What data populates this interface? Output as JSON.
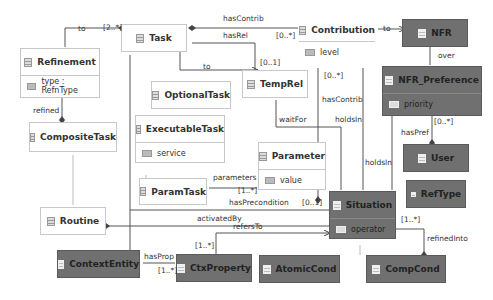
{
  "diagram": {
    "type": "uml-class-diagram",
    "classes": {
      "task": {
        "name": "Task"
      },
      "refinement": {
        "name": "Refinement",
        "attr": "type : RefnType"
      },
      "composite_task": {
        "name": "CompositeTask"
      },
      "optional_task": {
        "name": "OptionalTask"
      },
      "executable_task": {
        "name": "ExecutableTask",
        "attr": "service"
      },
      "param_task": {
        "name": "ParamTask"
      },
      "routine": {
        "name": "Routine"
      },
      "temp_rel": {
        "name": "TempRel"
      },
      "parameter": {
        "name": "Parameter",
        "attr": "value"
      },
      "contribution": {
        "name": "Contribution",
        "attr": "level"
      },
      "nfr": {
        "name": "NFR"
      },
      "nfr_preference": {
        "name": "NFR_Preference",
        "attr": "priority"
      },
      "user": {
        "name": "User"
      },
      "ref_type": {
        "name": "RefType"
      },
      "situation": {
        "name": "Situation",
        "attr": "operator"
      },
      "atomic_cond": {
        "name": "AtomicCond"
      },
      "comp_cond": {
        "name": "CompCond"
      },
      "context_entity": {
        "name": "ContextEntity"
      },
      "ctx_property": {
        "name": "CtxProperty"
      }
    },
    "labels": {
      "to_refinement": "to",
      "mult_2_star": "[2..*]",
      "has_contrib_top": "hasContrib",
      "has_rel": "hasRel",
      "mult_0_star_contrib": "[0..*]",
      "to_nfr": "to",
      "to_temprel": "to",
      "mult_0_1_temprel": "[0..1]",
      "over": "over",
      "refined": "refined",
      "mult_0_star_level": "[0..*]",
      "has_contrib_mid": "hasContrib",
      "wait_for": "waitFor",
      "holds_in_1": "holdsIn",
      "holds_in_2": "holdsIn",
      "mult_0_star_pref": "[0..*]",
      "has_pref": "hasPref",
      "parameters": "parameters",
      "mult_1_star_param": "[1..*]",
      "has_precondition": "hasPrecondition",
      "mult_0_1_precond": "[0..1]",
      "activated_by": "activatedBy",
      "refers_to": "refersTo",
      "mult_1_star_reftype": "[1..*]",
      "refined_into": "refinedInto",
      "mult_1_star_ctx": "[1..*]",
      "has_prop": "hasProp",
      "mult_1_star_hasprop": "[1..*]"
    },
    "colors": {
      "light_fill": "#ffffff",
      "dark_fill": "#707070",
      "line": "#555555"
    }
  }
}
